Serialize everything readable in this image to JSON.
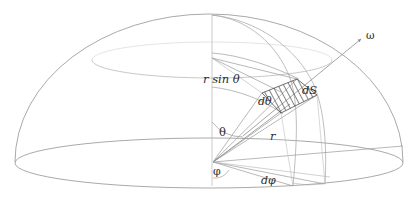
{
  "figure": {
    "kind": "hemisphere-solid-angle-diagram",
    "background_color": "#ffffff",
    "line_color": "#9a9a9a",
    "accent_line_color": "#8d8d8d",
    "hatch_color": "#3a3a3a",
    "label_color": "#2b2b2b",
    "canvas": {
      "width": 418,
      "height": 210
    }
  },
  "labels": {
    "r_sin_theta": "r sin θ",
    "dS": "dS",
    "d_theta": "dθ",
    "theta": "θ",
    "r": "r",
    "phi": "φ",
    "d_phi": "dφ",
    "omega": "ω"
  },
  "geometry": {
    "origin": {
      "x": 213,
      "y": 162
    },
    "pole": {
      "x": 212,
      "y": 15
    },
    "base_ellipse": {
      "cx": 209,
      "cy": 163,
      "rx": 194,
      "ry": 25
    },
    "dome_radius_x": 194,
    "dome_radius_y": 148,
    "latitude_ellipse": {
      "cx": 212,
      "cy": 60,
      "rx": 120,
      "ry": 18
    },
    "patch_center": {
      "x": 288,
      "y": 98
    },
    "omega_arrow_tip": {
      "x": 362,
      "y": 38
    }
  }
}
